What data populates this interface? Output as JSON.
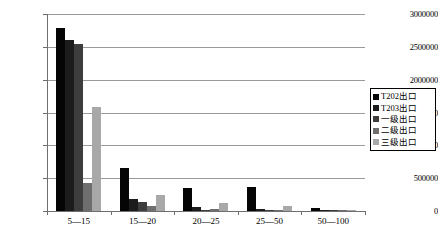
{
  "chart_data": {
    "type": "bar",
    "title": "",
    "xlabel": "",
    "ylabel": "",
    "ylim": [
      0,
      3000000
    ],
    "ytick_step": 500000,
    "grid": true,
    "legend_position": "right",
    "categories": [
      "5—15",
      "15—20",
      "20—25",
      "25—50",
      "50—100"
    ],
    "ytick_labels": [
      "3000000",
      "2500000",
      "2000000",
      "1500000",
      "1000000",
      "500000",
      "0"
    ],
    "ytick_values": [
      3000000,
      2500000,
      2000000,
      1500000,
      1000000,
      500000,
      0
    ],
    "series": [
      {
        "name": "T202出口",
        "color": "#050505",
        "values": [
          2790000,
          660000,
          350000,
          360000,
          40000
        ]
      },
      {
        "name": "T203出口",
        "color": "#1c1c1c",
        "values": [
          2600000,
          190000,
          60000,
          35000,
          20000
        ]
      },
      {
        "name": "一级出口",
        "color": "#3d3d3d",
        "values": [
          2550000,
          130000,
          20000,
          10000,
          10000
        ]
      },
      {
        "name": "二级出口",
        "color": "#6e6e6e",
        "values": [
          420000,
          75000,
          25000,
          15000,
          8000
        ]
      },
      {
        "name": "三级出口",
        "color": "#a8a8a8",
        "values": [
          1580000,
          250000,
          120000,
          70000,
          15000
        ]
      }
    ]
  }
}
